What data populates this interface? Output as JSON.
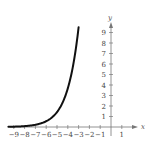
{
  "chart_data": {
    "type": "line",
    "title": "",
    "xlabel": "x",
    "ylabel": "y",
    "xlim": [
      -9.5,
      1.8
    ],
    "ylim": [
      -0.8,
      10.2
    ],
    "grid": false,
    "x_ticks": [
      -9,
      -8,
      -7,
      -6,
      -5,
      -4,
      -3,
      -2,
      -1,
      1
    ],
    "x_tick_labels": [
      "-9",
      "-8",
      "-7",
      "-6",
      "-5",
      "-4",
      "-3",
      "-2",
      "-1",
      "1"
    ],
    "y_ticks": [
      1,
      2,
      3,
      4,
      5,
      6,
      7,
      8,
      9
    ],
    "y_tick_labels": [
      "1",
      "2",
      "3",
      "4",
      "5",
      "6",
      "7",
      "8",
      "9"
    ],
    "series": [
      {
        "name": "exponential curve",
        "color": "#111111",
        "x": [
          -9.5,
          -9,
          -8,
          -7,
          -6.5,
          -6,
          -5.5,
          -5,
          -4.5,
          -4,
          -3.5,
          -3
        ],
        "y": [
          0.02,
          0.04,
          0.09,
          0.22,
          0.35,
          0.55,
          0.9,
          1.45,
          2.35,
          3.8,
          6.1,
          9.5
        ]
      }
    ]
  }
}
